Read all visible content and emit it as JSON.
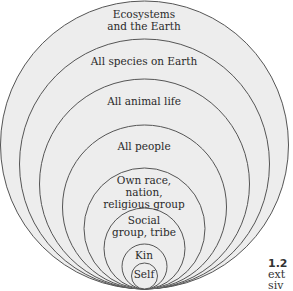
{
  "diagram": {
    "fill_color": "#ededed",
    "stroke_color": "#555555",
    "circles": [
      {
        "label_line1": "Ecosystems",
        "label_line2": "and the Earth"
      },
      {
        "label_line1": "All species on Earth"
      },
      {
        "label_line1": "All animal life"
      },
      {
        "label_line1": "All people"
      },
      {
        "label_line1": "Own race,",
        "label_line2": "nation,",
        "label_line3": "religious group"
      },
      {
        "label_line1": "Social",
        "label_line2": "group, tribe"
      },
      {
        "label_line1": "Kin"
      },
      {
        "label_line1": "Self"
      }
    ]
  },
  "caption": {
    "number": "1.2",
    "line2": "ext",
    "line3": "siv"
  }
}
